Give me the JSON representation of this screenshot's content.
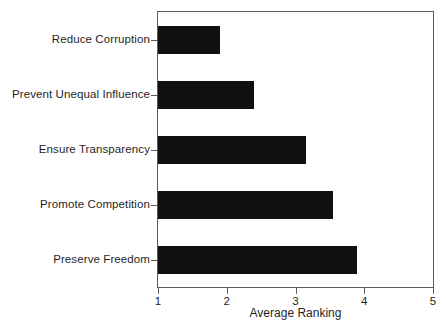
{
  "chart_data": {
    "type": "bar",
    "orientation": "horizontal",
    "title": "",
    "subtitle": "",
    "xlabel": "Average Ranking",
    "ylabel": "",
    "categories": [
      "Reduce Corruption",
      "Prevent Unequal Influence",
      "Ensure Transparency",
      "Promote Competition",
      "Preserve Freedom"
    ],
    "values": [
      1.9,
      2.4,
      3.15,
      3.55,
      3.9
    ],
    "xlim": [
      1,
      5
    ],
    "xticks": [
      1,
      2,
      3,
      4,
      5
    ],
    "xtick_labels": [
      "1",
      "2",
      "3",
      "4",
      "5"
    ],
    "bar_baseline": 1,
    "grid": false,
    "legend": false,
    "bar_color": "#101010",
    "frame_color": "#5a5a5a",
    "background_color": "#ffffff"
  }
}
